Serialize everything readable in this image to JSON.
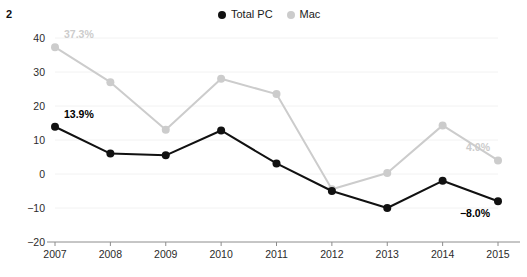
{
  "figure": {
    "number": "2"
  },
  "legend": {
    "position": "top-center",
    "entries": [
      {
        "label": "Total PC",
        "color": "#111111",
        "marker": "circle-marker"
      },
      {
        "label": "Mac",
        "color": "#cccccc",
        "marker": "circle-marker"
      }
    ]
  },
  "chart_data": {
    "type": "line",
    "title": "",
    "subtitle": "",
    "xlabel": "",
    "ylabel": "",
    "x": [
      "2007",
      "2008",
      "2009",
      "2010",
      "2011",
      "2012",
      "2013",
      "2014",
      "2015"
    ],
    "categories": [
      "2007",
      "2008",
      "2009",
      "2010",
      "2011",
      "2012",
      "2013",
      "2014",
      "2015"
    ],
    "series": [
      {
        "name": "Total PC",
        "color": "#111111",
        "values": [
          13.9,
          6.0,
          5.5,
          12.8,
          3.1,
          -5.0,
          -10.0,
          -2.0,
          -8.0
        ]
      },
      {
        "name": "Mac",
        "color": "#cccccc",
        "values": [
          37.3,
          27.0,
          13.0,
          28.0,
          23.5,
          -4.5,
          0.3,
          14.3,
          4.0
        ]
      }
    ],
    "annotations": [
      {
        "text": "37.3%",
        "series": "Mac",
        "x": "2007",
        "value": 37.3,
        "color": "#cccccc"
      },
      {
        "text": "13.9%",
        "series": "Total PC",
        "x": "2007",
        "value": 13.9,
        "color": "#000000"
      },
      {
        "text": "4.0%",
        "series": "Mac",
        "x": "2015",
        "value": 4.0,
        "color": "#cccccc"
      },
      {
        "text": "−8.0%",
        "series": "Total PC",
        "x": "2015",
        "value": -8.0,
        "color": "#000000"
      }
    ],
    "ylim": [
      -20,
      40
    ],
    "yticks": [
      "40",
      "30",
      "20",
      "10",
      "0",
      "−10",
      "−20"
    ],
    "ytick_values": [
      40,
      30,
      20,
      10,
      0,
      -10,
      -20
    ],
    "grid": true,
    "legend_position": "top-center"
  }
}
